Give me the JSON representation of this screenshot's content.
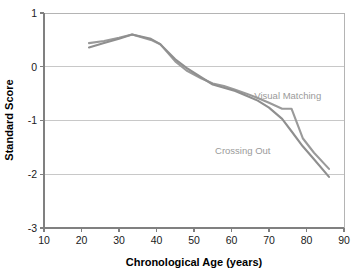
{
  "chart_data": {
    "type": "line",
    "title": "",
    "xlabel": "Chronological Age (years)",
    "ylabel": "Standard Score",
    "xlim": [
      10,
      90
    ],
    "ylim": [
      -3,
      1
    ],
    "xticks": [
      10,
      20,
      30,
      40,
      50,
      60,
      70,
      80,
      90
    ],
    "xtick_labels": [
      "10",
      "20",
      "30",
      "40",
      "50",
      "60",
      "70",
      "80",
      "90"
    ],
    "yticks": [
      1,
      0,
      -1,
      -2,
      -3
    ],
    "ytick_labels": [
      "1",
      "0",
      "-1",
      "-2",
      "-3"
    ],
    "grid": "horizontal",
    "gridline_values": [
      0,
      -1,
      -2
    ],
    "legend_position": "inline-annotations",
    "series": [
      {
        "name": "Visual Matching",
        "color": "#9a9a9a",
        "label_x": 75,
        "label_y": -0.6,
        "x": [
          22,
          26,
          30,
          33.5,
          38.5,
          41,
          45,
          48,
          52,
          55,
          58,
          61,
          64,
          67,
          70,
          73.5,
          76,
          79,
          82,
          86
        ],
        "y": [
          0.44,
          0.48,
          0.54,
          0.6,
          0.5,
          0.42,
          0.1,
          -0.07,
          -0.22,
          -0.31,
          -0.36,
          -0.43,
          -0.5,
          -0.58,
          -0.67,
          -0.78,
          -0.78,
          -1.33,
          -1.6,
          -1.9
        ]
      },
      {
        "name": "Crossing Out",
        "color": "#8f8f8f",
        "label_x": 63,
        "label_y": -1.62,
        "x": [
          22,
          26,
          30,
          33.5,
          38.5,
          41,
          45,
          48,
          52,
          55,
          58,
          61,
          64,
          67,
          70,
          73.5,
          76,
          79,
          82,
          86
        ],
        "y": [
          0.36,
          0.44,
          0.52,
          0.6,
          0.52,
          0.42,
          0.14,
          -0.02,
          -0.2,
          -0.33,
          -0.39,
          -0.45,
          -0.54,
          -0.63,
          -0.76,
          -0.97,
          -1.2,
          -1.48,
          -1.72,
          -2.05
        ]
      }
    ]
  },
  "axes": {
    "x_axis_title": "Chronological Age (years)",
    "y_axis_title": "Standard Score"
  },
  "annotations": {
    "visual_matching_label": "Visual Matching",
    "crossing_out_label": "Crossing Out"
  },
  "tick_text": {
    "x": [
      "10",
      "20",
      "30",
      "40",
      "50",
      "60",
      "70",
      "80",
      "90"
    ],
    "y": [
      "1",
      "0",
      "-1",
      "-2",
      "-3"
    ]
  }
}
